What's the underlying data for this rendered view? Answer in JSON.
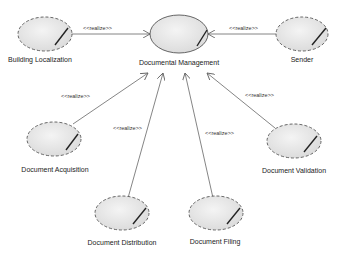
{
  "diagram": {
    "type": "uml-use-case",
    "central": {
      "id": "documental-management",
      "label": "Documental Management"
    },
    "use_cases": [
      {
        "id": "building-localization",
        "label": "Building Localization"
      },
      {
        "id": "sender",
        "label": "Sender"
      },
      {
        "id": "document-acquisition",
        "label": "Document Acquisition"
      },
      {
        "id": "document-validation",
        "label": "Document Validation"
      },
      {
        "id": "document-distribution",
        "label": "Document Distribution"
      },
      {
        "id": "document-filing",
        "label": "Document Filing"
      }
    ],
    "relations": [
      {
        "from": "building-localization",
        "to": "documental-management",
        "label": "<<realize>>"
      },
      {
        "from": "sender",
        "to": "documental-management",
        "label": "<<realize>>"
      },
      {
        "from": "document-acquisition",
        "to": "documental-management",
        "label": "<<realize>>"
      },
      {
        "from": "document-validation",
        "to": "documental-management",
        "label": "<<realize>>"
      },
      {
        "from": "document-distribution",
        "to": "documental-management",
        "label": "<<realize>>"
      },
      {
        "from": "document-filing",
        "to": "documental-management",
        "label": "<<realize>>"
      }
    ]
  },
  "colors": {
    "ellipse_fill": "#e8e8e8",
    "ellipse_stroke": "#555555",
    "line": "#666666",
    "text": "#222222"
  }
}
